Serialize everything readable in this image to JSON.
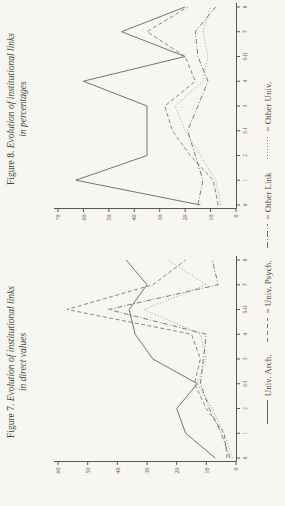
{
  "page": {
    "background": "#f7f6f2",
    "ink_color": "#5a5852"
  },
  "figures": [
    {
      "prefix": "Figure 7. ",
      "title": "Evolution of institutional links",
      "subtitle": "in direct values"
    },
    {
      "prefix": "Figure 8. ",
      "title": "Evolution of institutional links",
      "subtitle": "in percentages"
    }
  ],
  "legend": {
    "position": "bottom",
    "items": [
      {
        "label": "Univ. Arch.",
        "prefix": "",
        "style": "solid"
      },
      {
        "label": "Univ. Psych.",
        "prefix": "= ",
        "style": "dashed"
      },
      {
        "label": "Other Link",
        "prefix": "= ",
        "style": "dashdot"
      },
      {
        "label": "Other Univ.",
        "prefix": "= ",
        "style": "dotted"
      }
    ]
  },
  "chart_data": [
    {
      "type": "line",
      "title": "Figure 7. Evolution of institutional links in direct values",
      "x_labels": [
        "0",
        "1",
        "2",
        "S-I",
        "3",
        "4",
        "S-II",
        "7",
        "8"
      ],
      "ylim": [
        0,
        60
      ],
      "ytick_step": 10,
      "grid": false,
      "series": [
        {
          "name": "Univ. Arch.",
          "style": "solid",
          "values": [
            7,
            17,
            20,
            13,
            28,
            34,
            36,
            30,
            37
          ]
        },
        {
          "name": "Univ. Psych.",
          "style": "dashed",
          "values": [
            3,
            4,
            10,
            14,
            12,
            15,
            57,
            28,
            17
          ]
        },
        {
          "name": "Other Link",
          "style": "dashdot",
          "values": [
            2,
            5,
            9,
            12,
            11,
            10,
            43,
            6,
            8
          ]
        },
        {
          "name": "Other Univ.",
          "style": "dotted",
          "values": [
            1,
            4,
            8,
            13,
            10,
            12,
            31,
            10,
            23
          ]
        }
      ]
    },
    {
      "type": "line",
      "title": "Figure 8. Evolution of institutional links in percentages",
      "x_labels": [
        "0",
        "1",
        "2",
        "S-I",
        "3",
        "4",
        "S-II",
        "7",
        "8"
      ],
      "ylim": [
        0,
        70
      ],
      "ytick_step": 10,
      "grid": false,
      "series": [
        {
          "name": "Univ. Arch.",
          "style": "solid",
          "values": [
            14,
            63,
            35,
            35,
            35,
            60,
            20,
            45,
            20
          ]
        },
        {
          "name": "Univ. Psych.",
          "style": "dashed",
          "values": [
            7,
            9,
            18,
            25,
            28,
            16,
            20,
            35,
            19
          ]
        },
        {
          "name": "Other Link",
          "style": "dashdot",
          "values": [
            15,
            13,
            16,
            19,
            15,
            11,
            15,
            16,
            8
          ]
        },
        {
          "name": "Other Univ.",
          "style": "dotted",
          "values": [
            6,
            8,
            14,
            20,
            24,
            13,
            11,
            13,
            10
          ]
        }
      ]
    }
  ]
}
